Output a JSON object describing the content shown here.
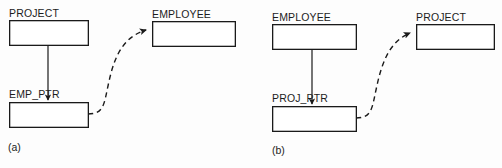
{
  "figure": {
    "type": "diagram",
    "width": 502,
    "height": 168,
    "background_color": "#fdfdfd",
    "line_color": "#1a1a1a",
    "panels": [
      {
        "id": "a",
        "caption": "(a)",
        "caption_pos": {
          "x": 8,
          "y": 141
        },
        "boxes": [
          {
            "name": "project-box-a",
            "label": "PROJECT",
            "label_pos": {
              "x": 9,
              "y": 7
            },
            "rect": {
              "x": 9,
              "y": 20,
              "w": 79,
              "h": 25
            }
          },
          {
            "name": "emp-ptr-box-a",
            "label": "EMP_PTR",
            "label_pos": {
              "x": 9,
              "y": 88
            },
            "rect": {
              "x": 9,
              "y": 102,
              "w": 79,
              "h": 25
            }
          },
          {
            "name": "employee-box-a",
            "label": "EMPLOYEE",
            "label_pos": {
              "x": 152,
              "y": 8
            },
            "rect": {
              "x": 152,
              "y": 21,
              "w": 83,
              "h": 25
            }
          }
        ],
        "connectors": [
          {
            "name": "owner-to-pointer-arrow-a",
            "style": "solid",
            "from": {
              "x": 48,
              "y": 45
            },
            "to": {
              "x": 48,
              "y": 102
            },
            "arrowhead": "to"
          },
          {
            "name": "pointer-reference-curve-a",
            "style": "dashed",
            "from": {
              "x": 88,
              "y": 114
            },
            "to": {
              "x": 150,
              "y": 30
            },
            "arrowhead": "to"
          }
        ]
      },
      {
        "id": "b",
        "caption": "(b)",
        "caption_pos": {
          "x": 272,
          "y": 144
        },
        "boxes": [
          {
            "name": "employee-box-b",
            "label": "EMPLOYEE",
            "label_pos": {
              "x": 272,
              "y": 11
            },
            "rect": {
              "x": 272,
              "y": 24,
              "w": 84,
              "h": 25
            }
          },
          {
            "name": "proj-ptr-box-b",
            "label": "PROJ_PTR",
            "label_pos": {
              "x": 272,
              "y": 92
            },
            "rect": {
              "x": 272,
              "y": 106,
              "w": 84,
              "h": 25
            }
          },
          {
            "name": "project-box-b",
            "label": "PROJECT",
            "label_pos": {
              "x": 416,
              "y": 11
            },
            "rect": {
              "x": 416,
              "y": 24,
              "w": 78,
              "h": 25
            }
          }
        ],
        "connectors": [
          {
            "name": "owner-to-pointer-arrow-b",
            "style": "solid",
            "from": {
              "x": 312,
              "y": 49
            },
            "to": {
              "x": 312,
              "y": 106
            },
            "arrowhead": "to"
          },
          {
            "name": "pointer-reference-curve-b",
            "style": "dashed",
            "from": {
              "x": 356,
              "y": 118
            },
            "to": {
              "x": 414,
              "y": 33
            },
            "arrowhead": "to"
          }
        ]
      }
    ]
  }
}
